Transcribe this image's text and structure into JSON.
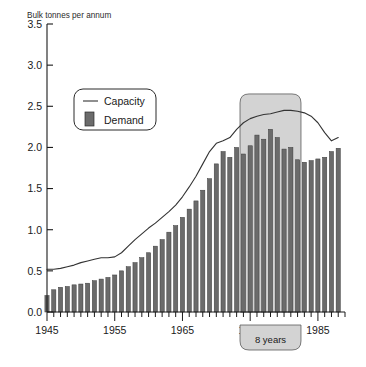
{
  "chart_data": {
    "type": "bar",
    "title": "Bulk tonnes per annum",
    "subtitle": "",
    "xlabel": "",
    "ylabel": "Bulk tonnes per annum",
    "ylim": [
      0.0,
      3.5
    ],
    "xlim": [
      1945,
      1989
    ],
    "ytick_labels": [
      "0.0",
      "0.5",
      "1.0",
      "1.5",
      "2.0",
      "2.5",
      "3.0",
      "3.5"
    ],
    "ytick_values": [
      0.0,
      0.5,
      1.0,
      1.5,
      2.0,
      2.5,
      3.0,
      3.5
    ],
    "xtick_labels": [
      "1945",
      "1955",
      "1965",
      "1975",
      "1985"
    ],
    "xtick_values": [
      1945,
      1955,
      1965,
      1975,
      1985
    ],
    "grid": false,
    "legend_position": "upper-left-inset",
    "legend": [
      {
        "name": "Capacity",
        "marker": "line",
        "color": "#333333"
      },
      {
        "name": "Demand",
        "marker": "bar",
        "color": "#6b6b6b"
      }
    ],
    "x": [
      1945,
      1946,
      1947,
      1948,
      1949,
      1950,
      1951,
      1952,
      1953,
      1954,
      1955,
      1956,
      1957,
      1958,
      1959,
      1960,
      1961,
      1962,
      1963,
      1964,
      1965,
      1966,
      1967,
      1968,
      1969,
      1970,
      1971,
      1972,
      1973,
      1974,
      1975,
      1976,
      1977,
      1978,
      1979,
      1980,
      1981,
      1982,
      1983,
      1984,
      1985,
      1986,
      1987,
      1988
    ],
    "series": [
      {
        "name": "Demand",
        "type": "bar",
        "color": "#6b6b6b",
        "values": [
          0.2,
          0.27,
          0.3,
          0.31,
          0.33,
          0.34,
          0.35,
          0.38,
          0.4,
          0.42,
          0.45,
          0.5,
          0.55,
          0.6,
          0.66,
          0.72,
          0.8,
          0.88,
          0.97,
          1.05,
          1.15,
          1.25,
          1.35,
          1.48,
          1.62,
          1.8,
          1.95,
          1.88,
          2.0,
          1.92,
          2.02,
          2.15,
          2.1,
          2.22,
          2.12,
          1.98,
          2.0,
          1.85,
          1.82,
          1.84,
          1.86,
          1.88,
          1.95,
          1.99
        ]
      },
      {
        "name": "Capacity",
        "type": "line",
        "color": "#333333",
        "values": [
          0.52,
          0.52,
          0.53,
          0.55,
          0.57,
          0.6,
          0.62,
          0.64,
          0.66,
          0.66,
          0.67,
          0.72,
          0.8,
          0.88,
          0.95,
          1.02,
          1.08,
          1.15,
          1.22,
          1.3,
          1.4,
          1.52,
          1.65,
          1.8,
          1.95,
          2.05,
          2.08,
          2.12,
          2.22,
          2.3,
          2.35,
          2.38,
          2.4,
          2.41,
          2.43,
          2.45,
          2.45,
          2.44,
          2.42,
          2.38,
          2.3,
          2.18,
          2.08,
          2.12
        ]
      }
    ],
    "annotations": [
      {
        "name": "highlight-region",
        "label": "",
        "x_start": 1974,
        "x_end": 1982,
        "y_top": 2.65,
        "color": "#d3d3d3"
      },
      {
        "name": "duration-callout",
        "label": "8 years",
        "x_start": 1974,
        "x_end": 1982
      }
    ]
  }
}
